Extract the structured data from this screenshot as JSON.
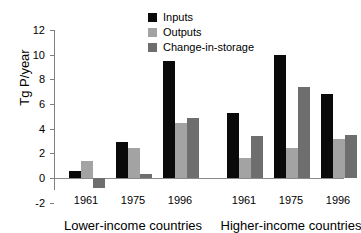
{
  "chart_data": {
    "type": "bar",
    "title": "",
    "subtitle": "",
    "xlabel": "",
    "ylabel": "Tg P/year",
    "ylim": [
      -2,
      12
    ],
    "ytick_values": [
      12,
      10,
      8,
      6,
      4,
      2,
      0,
      -2
    ],
    "ytick_labels": [
      "12",
      "10",
      "8",
      "6",
      "4",
      "2",
      "0",
      "-2"
    ],
    "grid": false,
    "legend_position": "top-center",
    "categories": [
      "1961",
      "1975",
      "1996",
      "1961",
      "1975",
      "1996"
    ],
    "group_labels": [
      "Lower-income countries",
      "Higher-income countries"
    ],
    "series": [
      {
        "name": "Inputs",
        "color": "#0a0a0a",
        "values": [
          0.6,
          2.9,
          9.5,
          5.25,
          10.0,
          6.8
        ]
      },
      {
        "name": "Outputs",
        "color": "#a3a3a3",
        "values": [
          1.4,
          2.4,
          4.5,
          1.65,
          2.4,
          3.2
        ]
      },
      {
        "name": "Change-in-storage",
        "color": "#6e6e6e",
        "values": [
          -0.8,
          0.3,
          4.9,
          3.4,
          7.4,
          3.5
        ]
      }
    ],
    "groups": [
      {
        "label": "Lower-income countries",
        "categories": [
          "1961",
          "1975",
          "1996"
        ],
        "inputs": [
          0.6,
          2.9,
          9.5
        ],
        "outputs": [
          1.4,
          2.4,
          4.5
        ],
        "change_in_storage": [
          -0.8,
          0.3,
          4.9
        ]
      },
      {
        "label": "Higher-income countries",
        "categories": [
          "1961",
          "1975",
          "1996"
        ],
        "inputs": [
          5.25,
          10.0,
          6.8
        ],
        "outputs": [
          1.65,
          2.4,
          3.2
        ],
        "change_in_storage": [
          3.4,
          7.4,
          3.5
        ]
      }
    ]
  },
  "legend": {
    "items": [
      {
        "label": "Inputs",
        "color": "#0a0a0a"
      },
      {
        "label": "Outputs",
        "color": "#a3a3a3"
      },
      {
        "label": "Change-in-storage",
        "color": "#6e6e6e"
      }
    ]
  },
  "axis": {
    "y_title": "Tg P/year",
    "y_ticks": [
      "12",
      "10",
      "8",
      "6",
      "4",
      "2",
      "0",
      "-2"
    ]
  },
  "x_categories": [
    "1961",
    "1975",
    "1996",
    "1961",
    "1975",
    "1996"
  ],
  "x_groups": [
    "Lower-income countries",
    "Higher-income countries"
  ],
  "colors": {
    "inputs": "#0a0a0a",
    "outputs": "#a3a3a3",
    "change_in_storage": "#6e6e6e",
    "axis": "#808080",
    "background": "#ffffff"
  }
}
